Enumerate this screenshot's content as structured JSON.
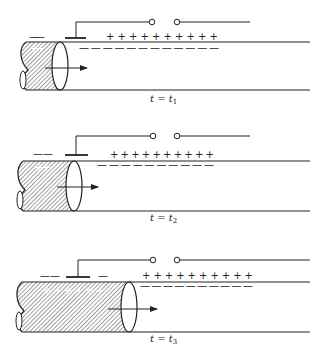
{
  "figure": {
    "panels": [
      {
        "label_var": "t",
        "label_eq": " = ",
        "label_rhs": "t",
        "label_sub": "1",
        "outer_plus": "+ + + + + + + + + +",
        "outer_minus": "— — — — — — — — — — — —",
        "left_minus": "— —",
        "left_minus_right": "",
        "inner_plus": "+ +",
        "plus_count": 10,
        "inner_plus_count": 2
      },
      {
        "label_var": "t",
        "label_eq": " = ",
        "label_rhs": "t",
        "label_sub": "2",
        "outer_plus": "+ + + + + + + + + +",
        "outer_minus": "— — — — — — — — — —",
        "left_minus": "— —",
        "left_minus_right": "",
        "inner_plus": "+ +",
        "plus_count": 10,
        "inner_plus_count": 2
      },
      {
        "label_var": "t",
        "label_eq": " = ",
        "label_rhs": "t",
        "label_sub": "3",
        "outer_plus": "+ + + + + + + + + +",
        "outer_minus": "— — — — — — — — — —",
        "left_minus": "— —",
        "left_minus_right": "—",
        "inner_plus": "+ + + + + +",
        "plus_count": 10,
        "inner_plus_count": 6
      }
    ]
  },
  "colors": {
    "ink": "#222222",
    "background": "#ffffff"
  }
}
